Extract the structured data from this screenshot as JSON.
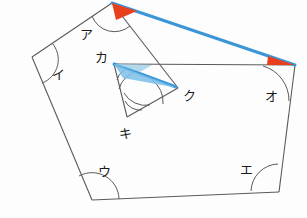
{
  "figure": {
    "canvas": {
      "width": 307,
      "height": 218
    },
    "colors": {
      "stroke": "#5a5a5a",
      "highlight_line": "#3b96d8",
      "highlight_wedge": "#e8401c",
      "inner_wedge": "#7cc0e8",
      "label_text": "#1a1a1a",
      "background": "#fdfdfd"
    },
    "outer_polygon": {
      "name": "pentagon",
      "vertices": [
        {
          "label": "ア",
          "x": 112,
          "y": 3,
          "label_x": 80,
          "label_y": 39
        },
        {
          "label": "イ",
          "x": 32,
          "y": 57,
          "label_x": 52,
          "label_y": 79
        },
        {
          "label": "ウ",
          "x": 92,
          "y": 200,
          "label_x": 98,
          "label_y": 176
        },
        {
          "label": "エ",
          "x": 279,
          "y": 192,
          "label_x": 240,
          "label_y": 174
        },
        {
          "label": "オ",
          "x": 295,
          "y": 65,
          "label_x": 265,
          "label_y": 101
        }
      ]
    },
    "inner_polygon": {
      "name": "triangle",
      "vertices": [
        {
          "label": "カ",
          "x": 114,
          "y": 64,
          "label_x": 95,
          "label_y": 62
        },
        {
          "label": "ク",
          "x": 178,
          "y": 88,
          "label_x": 183,
          "label_y": 100
        },
        {
          "label": "キ",
          "x": 127,
          "y": 117,
          "label_x": 119,
          "label_y": 138
        }
      ]
    },
    "highlighted_segments": [
      {
        "name": "segment-a-to-o",
        "from": "ア",
        "to": "オ",
        "x1": 112,
        "y1": 3,
        "x2": 295,
        "y2": 65
      },
      {
        "name": "segment-ka-to-ku",
        "from": "カ",
        "to": "ク",
        "x1": 114,
        "y1": 64,
        "x2": 178,
        "y2": 88
      }
    ],
    "marked_angles": [
      {
        "name": "angle-a",
        "vertex": "ア",
        "style": "red-wedge"
      },
      {
        "name": "angle-o",
        "vertex": "オ",
        "style": "red-wedge"
      },
      {
        "name": "angle-ku",
        "vertex": "ク",
        "style": "blue-wedge"
      },
      {
        "name": "angle-i",
        "vertex": "イ",
        "style": "arc"
      },
      {
        "name": "angle-u",
        "vertex": "ウ",
        "style": "arc"
      },
      {
        "name": "angle-e",
        "vertex": "エ",
        "style": "arc"
      },
      {
        "name": "angle-ka",
        "vertex": "カ",
        "style": "double-arc"
      },
      {
        "name": "angle-ki",
        "vertex": "キ",
        "style": "double-arc"
      }
    ]
  }
}
